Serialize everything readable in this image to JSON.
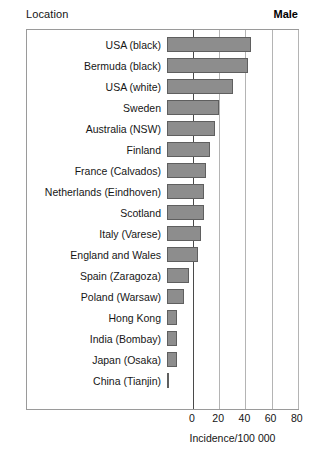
{
  "header": {
    "left_label": "Location",
    "right_label": "Male"
  },
  "axis": {
    "x_title": "Incidence/100 000",
    "ticks": [
      "0",
      "20",
      "40",
      "60",
      "80",
      "100"
    ]
  },
  "style": {
    "bar_fill": "#8d8d8d",
    "bar_border": "#5f5f5f",
    "frame_border": "#9a9a9a",
    "gridline": "#b4b4b4",
    "axis_line": "#4a4a4a"
  },
  "chart_data": {
    "type": "bar",
    "orientation": "horizontal",
    "title": "",
    "subtitle": "",
    "xlabel": "Incidence/100 000",
    "ylabel": "Location",
    "legend": [
      "Male"
    ],
    "legend_position": "top-right",
    "grid": true,
    "xlim": [
      0,
      100
    ],
    "xticks": [
      0,
      20,
      40,
      60,
      80,
      100
    ],
    "categories": [
      "USA (black)",
      "Bermuda (black)",
      "USA (white)",
      "Sweden",
      "Australia (NSW)",
      "Finland",
      "France (Calvados)",
      "Netherlands (Eindhoven)",
      "Scotland",
      "Italy (Varese)",
      "England and Wales",
      "Spain (Zaragoza)",
      "Poland (Warsaw)",
      "Hong Kong",
      "India (Bombay)",
      "Japan (Osaka)",
      "China (Tianjin)"
    ],
    "values": [
      64,
      62,
      50,
      40,
      37,
      33,
      30,
      28,
      28,
      26,
      24,
      17,
      13,
      8,
      8,
      8,
      1.5
    ]
  }
}
